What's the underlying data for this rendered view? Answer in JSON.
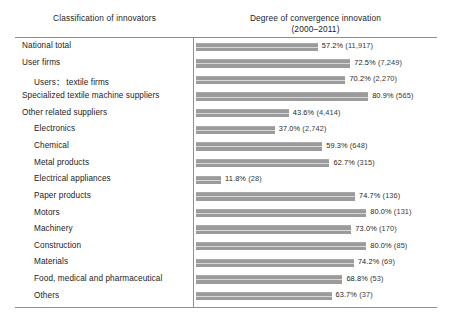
{
  "header": {
    "left_title": "Classification of innovators",
    "right_title": "Degree of convergence innovation",
    "right_subtitle": "(2000–2011)"
  },
  "style": {
    "bar_color": "#9b9b9b",
    "rule_color": "#8e8e8e",
    "text_color": "#1b1b1b"
  },
  "chart_data": {
    "type": "bar",
    "orientation": "horizontal",
    "title": "Degree of convergence innovation (2000–2011)",
    "xlabel": "",
    "ylabel": "Classification of innovators",
    "xlim": [
      0,
      100
    ],
    "grid": false,
    "legend": "none",
    "value_unit": "%",
    "categories": [
      "National total",
      "User firms",
      "Users: textile firms",
      "Specialized textile machine suppliers",
      "Other related suppliers",
      "Electronics",
      "Chemical",
      "Metal products",
      "Electrical appliances",
      "Paper products",
      "Motors",
      "Machinery",
      "Construction",
      "Materials",
      "Food, medical and pharmaceutical",
      "Others"
    ],
    "values": [
      57.2,
      72.5,
      70.2,
      80.9,
      43.6,
      37.0,
      59.3,
      62.7,
      11.8,
      74.7,
      80.0,
      73.0,
      80.0,
      74.2,
      68.8,
      63.7
    ],
    "counts": [
      11917,
      7249,
      2270,
      565,
      4414,
      2742,
      648,
      315,
      28,
      136,
      131,
      170,
      85,
      69,
      53,
      37
    ]
  },
  "rows": [
    {
      "label": "National total",
      "indent": 0,
      "value": 57.2,
      "value_text": "57.2%",
      "count_text": "(11,917)"
    },
    {
      "label": "User firms",
      "indent": 0,
      "value": 72.5,
      "value_text": "72.5%",
      "count_text": "(7,249)"
    },
    {
      "label": "Users： textile firms",
      "indent": 1,
      "value": 70.2,
      "value_text": "70.2%",
      "count_text": "(2,270)"
    },
    {
      "label": "Specialized textile machine suppliers",
      "indent": 0,
      "value": 80.9,
      "value_text": "80.9%",
      "count_text": "(565)"
    },
    {
      "label": "Other related suppliers",
      "indent": 0,
      "value": 43.6,
      "value_text": "43.6%",
      "count_text": "(4,414)"
    },
    {
      "label": "Electronics",
      "indent": 1,
      "value": 37.0,
      "value_text": "37.0%",
      "count_text": "(2,742)"
    },
    {
      "label": "Chemical",
      "indent": 1,
      "value": 59.3,
      "value_text": "59.3%",
      "count_text": "(648)"
    },
    {
      "label": "Metal products",
      "indent": 1,
      "value": 62.7,
      "value_text": "62.7%",
      "count_text": "(315)"
    },
    {
      "label": "Electrical appliances",
      "indent": 1,
      "value": 11.8,
      "value_text": "11.8%",
      "count_text": "(28)"
    },
    {
      "label": "Paper products",
      "indent": 1,
      "value": 74.7,
      "value_text": "74.7%",
      "count_text": "(136)"
    },
    {
      "label": "Motors",
      "indent": 1,
      "value": 80.0,
      "value_text": "80.0%",
      "count_text": "(131)"
    },
    {
      "label": "Machinery",
      "indent": 1,
      "value": 73.0,
      "value_text": "73.0%",
      "count_text": "(170)"
    },
    {
      "label": "Construction",
      "indent": 1,
      "value": 80.0,
      "value_text": "80.0%",
      "count_text": "(85)"
    },
    {
      "label": "Materials",
      "indent": 1,
      "value": 74.2,
      "value_text": "74.2%",
      "count_text": "(69)"
    },
    {
      "label": "Food, medical and pharmaceutical",
      "indent": 1,
      "value": 68.8,
      "value_text": "68.8%",
      "count_text": "(53)"
    },
    {
      "label": "Others",
      "indent": 1,
      "value": 63.7,
      "value_text": "63.7%",
      "count_text": "(37)"
    }
  ]
}
